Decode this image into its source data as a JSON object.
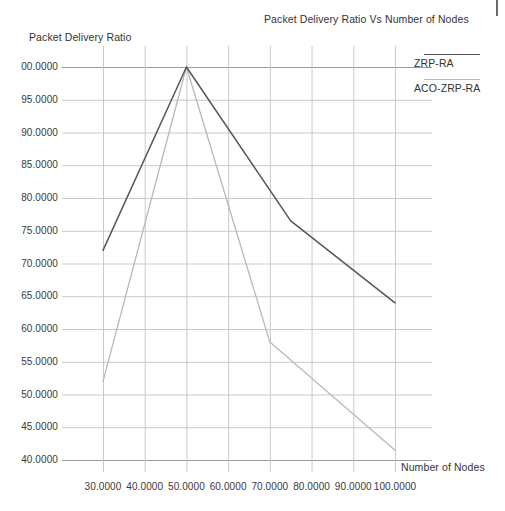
{
  "page": {
    "background": "#ffffff",
    "page_mark": "page-edge-rule"
  },
  "chart_data": {
    "type": "line",
    "title": "Packet Delivery Ratio Vs Number of Nodes",
    "xlabel": "Number of Nodes",
    "ylabel": "Packet Delivery Ratio",
    "grid": true,
    "legend_position": "right",
    "xlim": [
      25,
      105
    ],
    "ylim": [
      40,
      100
    ],
    "xticks": [
      30,
      40,
      50,
      60,
      70,
      80,
      90,
      100
    ],
    "xtick_labels": [
      "30.0000",
      "40.0000",
      "50.0000",
      "60.0000",
      "70.0000",
      "80.0000",
      "90.0000",
      "100.0000"
    ],
    "yticks": [
      40,
      45,
      50,
      55,
      60,
      65,
      70,
      75,
      80,
      85,
      90,
      95,
      100
    ],
    "ytick_labels": [
      "40.0000",
      "45.0000",
      "50.0000",
      "55.0000",
      "60.0000",
      "65.0000",
      "70.0000",
      "75.0000",
      "80.0000",
      "85.0000",
      "90.0000",
      "95.0000",
      "00.0000"
    ],
    "series": [
      {
        "name": "ZRP-RA",
        "color": "#55555a",
        "x": [
          30,
          50,
          75,
          100
        ],
        "values": [
          72.0,
          100.0,
          76.5,
          64.0
        ]
      },
      {
        "name": "ACO-ZRP-RA",
        "color": "#b9b9bc",
        "x": [
          30,
          50,
          70,
          100
        ],
        "values": [
          52.0,
          100.0,
          58.0,
          41.5
        ]
      }
    ]
  },
  "legend": {
    "entries": [
      {
        "label": "ZRP-RA",
        "color": "#55555a"
      },
      {
        "label": "ACO-ZRP-RA",
        "color": "#b9b9bc"
      }
    ]
  },
  "axis_colors": {
    "grid": "#c9c9cc",
    "axis": "#9a9a9e",
    "text": "#3a3a3a"
  }
}
